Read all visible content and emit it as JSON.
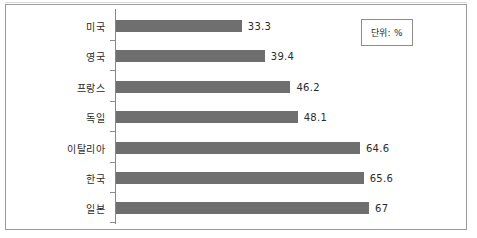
{
  "chart_data": {
    "type": "bar",
    "orientation": "horizontal",
    "title": "",
    "subtitle": "",
    "xlabel": "",
    "ylabel": "",
    "unit_note": "단위: %",
    "categories": [
      "미국",
      "영국",
      "프랑스",
      "독일",
      "이탈리아",
      "한국",
      "일본"
    ],
    "values": [
      33.3,
      39.4,
      46.2,
      48.1,
      64.6,
      65.6,
      67
    ],
    "value_labels": [
      "33.3",
      "39.4",
      "46.2",
      "48.1",
      "64.6",
      "65.6",
      "67"
    ],
    "xlim": [
      0,
      67
    ],
    "grid": false,
    "legend": "none",
    "bar_color": "#6f6f6f",
    "frame_color": "#9a9a9a",
    "axis_color": "#868686",
    "text_color": "#2b2b2b"
  },
  "legend_box": {
    "label": "단위: %"
  },
  "rows": [
    {
      "category": "미국",
      "value_label": "33.3"
    },
    {
      "category": "영국",
      "value_label": "39.4"
    },
    {
      "category": "프랑스",
      "value_label": "46.2"
    },
    {
      "category": "독일",
      "value_label": "48.1"
    },
    {
      "category": "이탈리아",
      "value_label": "64.6"
    },
    {
      "category": "한국",
      "value_label": "65.6"
    },
    {
      "category": "일본",
      "value_label": "67"
    }
  ]
}
